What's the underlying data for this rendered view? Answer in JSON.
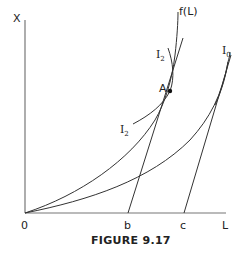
{
  "figure": {
    "caption": "FIGURE 9.17",
    "axes": {
      "y_label": "X",
      "x_label": "L",
      "origin_label": "0"
    },
    "ticks": {
      "b": "b",
      "c": "c"
    },
    "curves": {
      "production_function": {
        "label": "f(L)"
      },
      "indifference_upper": {
        "label": "I",
        "subscript": "2"
      },
      "indifference_lower": {
        "label": "I",
        "subscript": "2"
      },
      "indifference_right": {
        "label": "I",
        "subscript": "0"
      }
    },
    "points": {
      "tangency": {
        "label": "A"
      }
    },
    "colors": {
      "line": "#333333",
      "axis": "#777777",
      "text": "#222222"
    }
  }
}
